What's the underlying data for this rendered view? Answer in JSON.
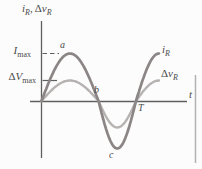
{
  "figure": {
    "background": "#fcfcfc",
    "colors": {
      "axis": "#5f5f5f",
      "text": "#4a4a4a",
      "current_curve": "#8b8585",
      "voltage_curve": "#b7b2b2",
      "border_line": "#b3b3b3"
    },
    "axis_label_y": {
      "part1": "i",
      "part1_sub": "R",
      "separator": ",",
      "part2_delta": "Δ",
      "part2": "v",
      "part2_sub": "R"
    },
    "axis_label_x": "t",
    "imax_label": {
      "symbol": "I",
      "sub": "max"
    },
    "vmax_label": {
      "delta": "Δ",
      "symbol": "V",
      "sub": "max"
    },
    "curve_label_current": {
      "symbol": "i",
      "sub": "R"
    },
    "curve_label_voltage": {
      "delta": "Δ",
      "symbol": "v",
      "sub": "R"
    },
    "point_labels": {
      "a": "a",
      "b": "b",
      "c": "c",
      "T": "T"
    }
  },
  "chart_data": {
    "type": "line",
    "title": "",
    "xlabel": "t",
    "ylabel": "i_R, Δv_R",
    "x_axis": {
      "unit": "time (periods of T)",
      "range_in_periods": [
        0,
        1.3
      ],
      "ticks": [
        {
          "label": "T",
          "x": 1.0
        }
      ]
    },
    "y_axis": {
      "numeric_labels": false,
      "ticks": [
        {
          "label": "I_max",
          "y": 1.0,
          "style": "dashed-reference"
        },
        {
          "label": "ΔV_max",
          "y": 0.45,
          "style": "solid-reference"
        }
      ]
    },
    "x": [
      0,
      0.125,
      0.25,
      0.375,
      0.5,
      0.625,
      0.75,
      0.875,
      1.0,
      1.125,
      1.25
    ],
    "series": [
      {
        "name": "i_R",
        "peak_label": "I_max",
        "relative_amplitude": 1.0,
        "color": "#8b8585",
        "values": [
          0,
          0.71,
          1.0,
          0.71,
          0,
          -0.71,
          -1.0,
          -0.71,
          0,
          0.71,
          1.0
        ]
      },
      {
        "name": "Δv_R",
        "peak_label": "ΔV_max",
        "relative_amplitude": 0.45,
        "color": "#b7b2b2",
        "values": [
          0,
          0.32,
          0.45,
          0.32,
          0,
          -0.32,
          -0.45,
          -0.32,
          0,
          0.32,
          0.45
        ]
      }
    ],
    "annotations": [
      {
        "label": "a",
        "x": 0.25,
        "y": 1.0
      },
      {
        "label": "b",
        "x": 0.5,
        "y": 0
      },
      {
        "label": "c",
        "x": 0.75,
        "y": -1.0
      },
      {
        "label": "T",
        "x": 1.0,
        "y": 0
      }
    ],
    "legend": {
      "position": "right-of-curves",
      "entries": [
        "i_R",
        "Δv_R"
      ]
    },
    "grid": false
  }
}
